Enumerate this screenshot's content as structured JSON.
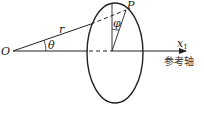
{
  "diagram": {
    "type": "geometry",
    "labels": {
      "origin": "O",
      "point": "P",
      "radius": "r",
      "theta": "θ",
      "phi": "φ",
      "axis_symbol": "x",
      "axis_subscript": "1",
      "axis_name": "参考轴"
    },
    "colors": {
      "stroke": "#222222",
      "background": "#ffffff"
    }
  }
}
